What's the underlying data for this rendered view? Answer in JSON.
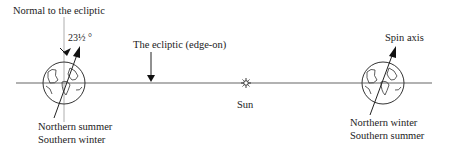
{
  "diagram": {
    "labels": {
      "normal": "Normal to the ecliptic",
      "angle": "23½ °",
      "ecliptic": "The ecliptic (edge-on)",
      "sun": "Sun",
      "spin_axis": "Spin axis",
      "left_caption_1": "Northern summer",
      "left_caption_2": "Southern winter",
      "right_caption_1": "Northern winter",
      "right_caption_2": "Southern summer"
    },
    "colors": {
      "line": "#555555",
      "ink": "#222222",
      "background": "#ffffff"
    }
  }
}
